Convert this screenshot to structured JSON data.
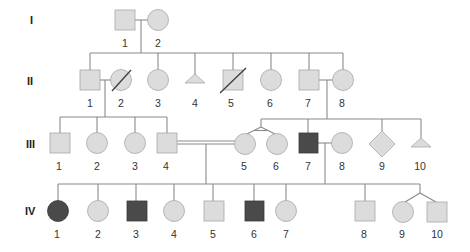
{
  "diagram": {
    "type": "pedigree",
    "colors": {
      "unaffected_fill": "#dcdcdc",
      "affected_fill": "#4a4a4a",
      "line": "#8a8a8a"
    },
    "generations": [
      {
        "label": "I",
        "individuals": [
          {
            "id": "1",
            "sex": "male",
            "affected": false,
            "deceased": false
          },
          {
            "id": "2",
            "sex": "female",
            "affected": false,
            "deceased": false
          }
        ]
      },
      {
        "label": "II",
        "individuals": [
          {
            "id": "1",
            "sex": "male",
            "affected": false,
            "deceased": false
          },
          {
            "id": "2",
            "sex": "female",
            "affected": false,
            "deceased": true
          },
          {
            "id": "3",
            "sex": "female",
            "affected": false,
            "deceased": false
          },
          {
            "id": "4",
            "sex": "miscarriage",
            "affected": false,
            "deceased": false
          },
          {
            "id": "5",
            "sex": "male",
            "affected": false,
            "deceased": true
          },
          {
            "id": "6",
            "sex": "female",
            "affected": false,
            "deceased": false
          },
          {
            "id": "7",
            "sex": "male",
            "affected": false,
            "deceased": false
          },
          {
            "id": "8",
            "sex": "female",
            "affected": false,
            "deceased": false
          }
        ]
      },
      {
        "label": "III",
        "individuals": [
          {
            "id": "1",
            "sex": "male",
            "affected": false
          },
          {
            "id": "2",
            "sex": "female",
            "affected": false
          },
          {
            "id": "3",
            "sex": "female",
            "affected": false
          },
          {
            "id": "4",
            "sex": "male",
            "affected": false
          },
          {
            "id": "5",
            "sex": "female",
            "affected": false,
            "twin": "monozygotic"
          },
          {
            "id": "6",
            "sex": "female",
            "affected": false,
            "twin": "monozygotic"
          },
          {
            "id": "7",
            "sex": "male",
            "affected": true
          },
          {
            "id": "8",
            "sex": "female",
            "affected": false
          },
          {
            "id": "9",
            "sex": "unknown",
            "affected": false
          },
          {
            "id": "10",
            "sex": "miscarriage",
            "affected": false
          }
        ]
      },
      {
        "label": "IV",
        "individuals": [
          {
            "id": "1",
            "sex": "female",
            "affected": true
          },
          {
            "id": "2",
            "sex": "female",
            "affected": false
          },
          {
            "id": "3",
            "sex": "male",
            "affected": true
          },
          {
            "id": "4",
            "sex": "female",
            "affected": false
          },
          {
            "id": "5",
            "sex": "male",
            "affected": false
          },
          {
            "id": "6",
            "sex": "male",
            "affected": true
          },
          {
            "id": "7",
            "sex": "female",
            "affected": false
          },
          {
            "id": "8",
            "sex": "male",
            "affected": false
          },
          {
            "id": "9",
            "sex": "female",
            "affected": false,
            "twin": "dizygotic"
          },
          {
            "id": "10",
            "sex": "male",
            "affected": false,
            "twin": "dizygotic"
          }
        ]
      }
    ],
    "relationships": [
      {
        "partners": [
          "I-1",
          "I-2"
        ],
        "type": "mating"
      },
      {
        "partners": [
          "II-1",
          "II-2"
        ],
        "type": "mating"
      },
      {
        "partners": [
          "II-7",
          "II-8"
        ],
        "type": "mating"
      },
      {
        "partners": [
          "III-4",
          "III-5"
        ],
        "type": "consanguineous"
      },
      {
        "partners": [
          "III-7",
          "III-8"
        ],
        "type": "mating"
      }
    ]
  }
}
